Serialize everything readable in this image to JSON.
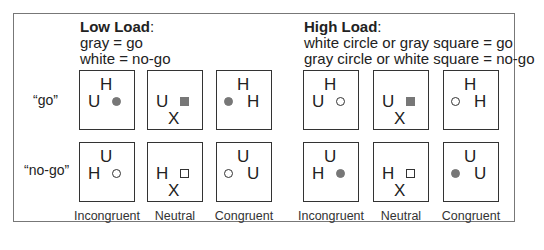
{
  "low_load": {
    "title": "Low Load",
    "colon": ":",
    "rule1": "gray = go",
    "rule2": "white = no-go"
  },
  "high_load": {
    "title": "High Load",
    "colon": ":",
    "rule1": "white circle or gray square = go",
    "rule2": "gray circle or white square = no-go"
  },
  "rows": {
    "go": "“go”",
    "nogo": "“no-go”"
  },
  "columns": [
    "Incongruent",
    "Neutral",
    "Congruent",
    "Incongruent",
    "Neutral",
    "Congruent"
  ],
  "stimuli": {
    "low_go": [
      {
        "top": "H",
        "left": "U",
        "shape": "gray-circle"
      },
      {
        "left": "U",
        "bottom": "X",
        "shape": "gray-square"
      },
      {
        "top": "H",
        "right": "H",
        "shape": "gray-circle"
      }
    ],
    "low_nogo": [
      {
        "top": "U",
        "left": "H",
        "shape": "white-circle"
      },
      {
        "left": "H",
        "bottom": "X",
        "shape": "white-square"
      },
      {
        "top": "U",
        "right": "U",
        "shape": "white-circle"
      }
    ],
    "high_go": [
      {
        "top": "H",
        "left": "U",
        "shape": "white-circle"
      },
      {
        "left": "U",
        "bottom": "X",
        "shape": "gray-square"
      },
      {
        "top": "H",
        "right": "H",
        "shape": "white-circle"
      }
    ],
    "high_nogo": [
      {
        "top": "U",
        "left": "H",
        "shape": "gray-circle"
      },
      {
        "left": "H",
        "bottom": "X",
        "shape": "white-square"
      },
      {
        "top": "U",
        "right": "U",
        "shape": "gray-circle"
      }
    ]
  },
  "colors": {
    "gray": "#777777",
    "border": "#333333"
  }
}
